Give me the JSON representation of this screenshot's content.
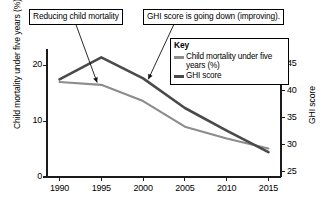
{
  "chart_data": {
    "type": "line",
    "title": "",
    "xlabel": "",
    "x": [
      1990,
      1995,
      2000,
      2005,
      2010,
      2015
    ],
    "xticklabels": [
      "1990",
      "1995",
      "2000",
      "2005",
      "2010",
      "2015"
    ],
    "xlim": [
      1988.5,
      2016.5
    ],
    "grid": false,
    "legend_position": "upper-right",
    "left_axis": {
      "label": "Child mortality under five years (%)",
      "ticks": [
        0,
        10,
        20
      ],
      "ticklabels": [
        "0",
        "10",
        "20"
      ],
      "lim": [
        0,
        22.2
      ]
    },
    "right_axis": {
      "label": "GHI score",
      "ticks": [
        25,
        30,
        35,
        40,
        45
      ],
      "ticklabels": [
        "25",
        "30",
        "35",
        "40",
        "45"
      ],
      "lim": [
        24.0,
        47.0
      ]
    },
    "series": [
      {
        "name": "Child mortality under five years (%)",
        "axis": "left",
        "color": "#8c8c8c",
        "values": [
          17.0,
          16.5,
          13.6,
          9.0,
          6.9,
          5.1
        ]
      },
      {
        "name": "GHI score",
        "axis": "right",
        "color": "#4a4a4a",
        "values": [
          42.1,
          46.2,
          42.3,
          36.8,
          32.6,
          28.6
        ]
      }
    ],
    "annotations": [
      {
        "id": "callout-mortality",
        "text": "Reducing child mortality",
        "points_to_series": "Child mortality under five years (%)",
        "points_to_x": 1994.5
      },
      {
        "id": "callout-ghi",
        "text": "GHI score is going down (improving).",
        "points_to_series": "GHI score",
        "points_to_x": 2000.5
      }
    ]
  },
  "legend": {
    "title": "Key",
    "entries": [
      {
        "label": "Child mortality under five years (%)",
        "color": "#8c8c8c"
      },
      {
        "label": "GHI score",
        "color": "#4a4a4a"
      }
    ]
  }
}
